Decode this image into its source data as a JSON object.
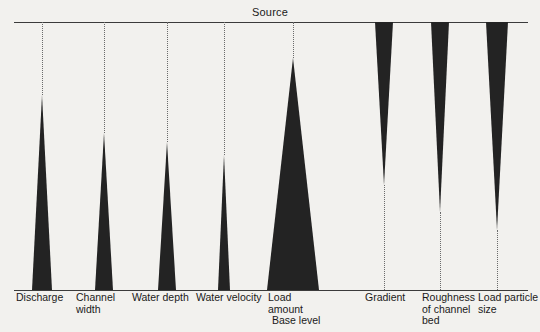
{
  "figure": {
    "title_top": "Source",
    "title_bottom": "Base level",
    "background_color": "#f2f1ee",
    "wedge_color": "#232323",
    "line_color": "#3b3b3b",
    "guide_style": "dotted"
  },
  "chart_data": {
    "type": "diagram",
    "axis": {
      "top_label": "Source",
      "bottom_label": "Base level",
      "top_y": 22,
      "bottom_y": 290,
      "left_x": 14,
      "right_x": 528,
      "grid": false,
      "legend": "none"
    },
    "variables": [
      {
        "label": "Discharge",
        "trend": "increases downstream",
        "orientation": "apex-up",
        "apex_y": 95,
        "base_y": 290,
        "base_half_width": 10,
        "center_x": 42,
        "guide_from_y": 22,
        "guide_to_y": 95
      },
      {
        "label": "Channel\nwidth",
        "trend": "increases downstream",
        "orientation": "apex-up",
        "apex_y": 133,
        "base_y": 290,
        "base_half_width": 9,
        "center_x": 104,
        "guide_from_y": 22,
        "guide_to_y": 133
      },
      {
        "label": "Water depth",
        "trend": "increases downstream",
        "orientation": "apex-up",
        "apex_y": 142,
        "base_y": 290,
        "base_half_width": 9,
        "center_x": 167,
        "guide_from_y": 22,
        "guide_to_y": 142
      },
      {
        "label": "Water velocity",
        "trend": "increases downstream",
        "orientation": "apex-up",
        "apex_y": 155,
        "base_y": 290,
        "base_half_width": 6,
        "center_x": 224,
        "guide_from_y": 22,
        "guide_to_y": 155
      },
      {
        "label": "Load\n   amount",
        "trend": "increases downstream",
        "orientation": "apex-up",
        "apex_y": 58,
        "base_y": 290,
        "base_half_width": 26,
        "center_x": 293,
        "guide_from_y": 22,
        "guide_to_y": 58
      },
      {
        "label": "Gradient",
        "trend": "decreases downstream",
        "orientation": "apex-down",
        "apex_y": 185,
        "base_y": 22,
        "base_half_width": 9,
        "center_x": 384,
        "guide_from_y": 185,
        "guide_to_y": 290
      },
      {
        "label": "Roughness\nof channel\nbed",
        "trend": "decreases downstream",
        "orientation": "apex-down",
        "apex_y": 212,
        "base_y": 22,
        "base_half_width": 9,
        "center_x": 440,
        "guide_from_y": 212,
        "guide_to_y": 290
      },
      {
        "label": "Load particle\nsize",
        "trend": "decreases downstream",
        "orientation": "apex-down",
        "apex_y": 230,
        "base_y": 22,
        "base_half_width": 11,
        "center_x": 497,
        "guide_from_y": 230,
        "guide_to_y": 290
      }
    ],
    "labels_row": [
      {
        "text": "Discharge",
        "x": 16,
        "y": 292
      },
      {
        "text": "Channel\nwidth",
        "x": 76,
        "y": 292
      },
      {
        "text": "Water depth",
        "x": 132,
        "y": 292
      },
      {
        "text": "Water velocity",
        "x": 196,
        "y": 292
      },
      {
        "text": "Load\n   amount",
        "x": 268,
        "y": 292
      },
      {
        "text": "Gradient",
        "x": 365,
        "y": 292
      },
      {
        "text": "Roughness\nof channel\nbed",
        "x": 422,
        "y": 292
      },
      {
        "text": "Load particle\nsize",
        "x": 478,
        "y": 292
      }
    ]
  }
}
